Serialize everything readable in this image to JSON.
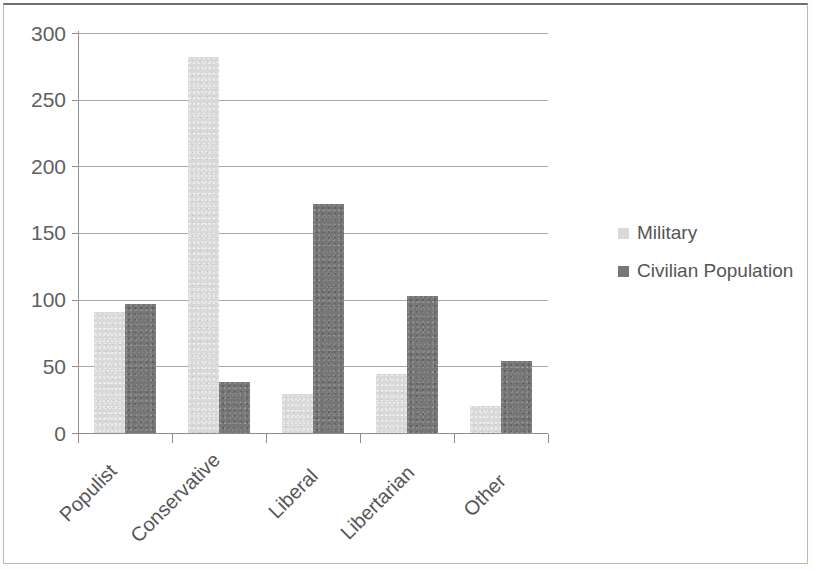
{
  "chart_data": {
    "type": "bar",
    "title": "",
    "subtitle": "",
    "xlabel": "",
    "ylabel": "",
    "ylim": [
      0,
      300
    ],
    "yticks": [
      "0",
      "50",
      "100",
      "150",
      "200",
      "250",
      "300"
    ],
    "grid": true,
    "legend_position": "right",
    "orientation": "vertical",
    "grouping": "grouped",
    "categories": [
      "Populist",
      "Conservative",
      "Liberal",
      "Libertarian",
      "Other"
    ],
    "series": [
      {
        "name": "Military",
        "color": "#d9d9d9",
        "values": [
          91,
          282,
          29,
          44,
          20
        ]
      },
      {
        "name": "Civilian Population",
        "color": "#767676",
        "values": [
          97,
          38,
          172,
          103,
          54
        ]
      }
    ]
  },
  "axis": {
    "y_tick_labels": [
      "300",
      "250",
      "200",
      "150",
      "100",
      "50",
      "0"
    ],
    "x_tick_labels": [
      "Populist",
      "Conservative",
      "Liberal",
      "Libertarian",
      "Other"
    ]
  },
  "legend": {
    "entries": [
      {
        "label": "Military",
        "color": "#d9d9d9",
        "swatch": "legend-swatch-military"
      },
      {
        "label": "Civilian Population",
        "color": "#767676",
        "swatch": "legend-swatch-civilian"
      }
    ]
  },
  "colors": {
    "military": "#d9d9d9",
    "civilian": "#767676",
    "gridline": "#a8a8a8",
    "axis": "#8d8d8d",
    "text": "#555555",
    "frame": "#b9b9b9",
    "page_background": "#ffffff"
  }
}
